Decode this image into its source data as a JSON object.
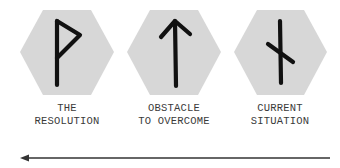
{
  "colors": {
    "hexagon_fill": "#d7d7d7",
    "rune_stroke": "#111111",
    "label_text": "#3a3a3a",
    "arrow": "#333333",
    "background": "#ffffff"
  },
  "cards": [
    {
      "rune_name": "wunjo-rune",
      "label_lines": [
        "THE",
        "RESOLUTION"
      ]
    },
    {
      "rune_name": "tiwaz-rune",
      "label_lines": [
        "OBSTACLE",
        "TO OVERCOME"
      ]
    },
    {
      "rune_name": "nauthiz-rune",
      "label_lines": [
        "CURRENT",
        "SITUATION"
      ]
    }
  ],
  "arrow": {
    "direction": "right-to-left",
    "icon": "arrow-left-icon"
  }
}
